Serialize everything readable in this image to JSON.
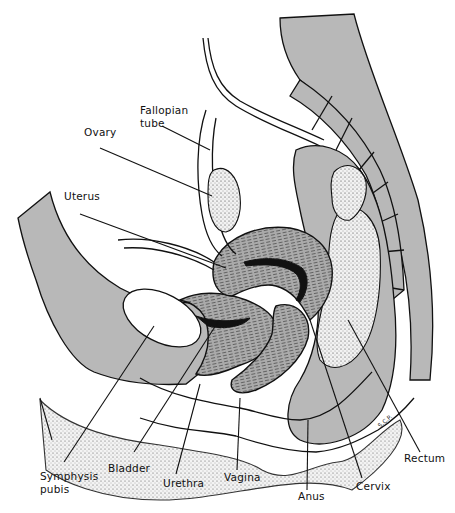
{
  "figure": {
    "signature": "S.C.P.",
    "colors": {
      "tissue": "#b8b8b8",
      "line": "#111111",
      "background": "#ffffff"
    }
  },
  "labels": {
    "fallopian_tube": [
      "Fallopian",
      "tube"
    ],
    "ovary": "Ovary",
    "uterus": "Uterus",
    "symphysis_pubis": [
      "Symphysis",
      "pubis"
    ],
    "bladder": "Bladder",
    "urethra": "Urethra",
    "vagina": "Vagina",
    "anus": "Anus",
    "cervix": "Cervix",
    "rectum": "Rectum"
  }
}
